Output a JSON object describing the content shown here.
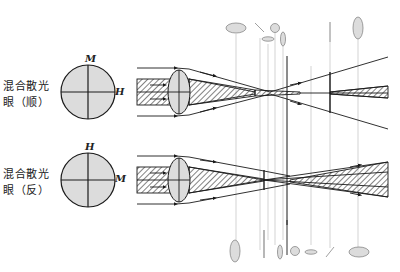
{
  "caption": {
    "text": "",
    "note": ""
  },
  "rows": [
    {
      "label_line1": "混合散光",
      "label_line2": "眼（顺）",
      "vertical_axis_label": "M",
      "horizontal_axis_label": "H"
    },
    {
      "label_line1": "混合散光",
      "label_line2": "眼（反）",
      "vertical_axis_label": "H",
      "horizontal_axis_label": "M"
    }
  ],
  "colors": {
    "line": "#1a1a1a",
    "fill": "#dcdcdc",
    "guide": "#c8c8c8",
    "background": "#ffffff"
  }
}
